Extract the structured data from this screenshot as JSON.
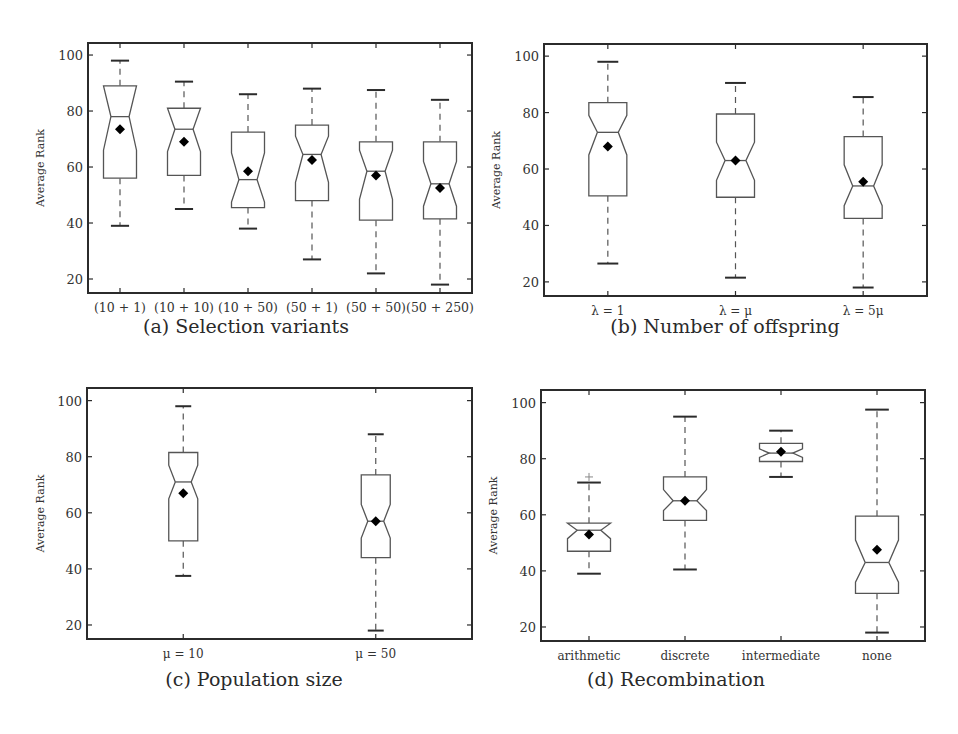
{
  "figure": {
    "panels": [
      {
        "id": "a",
        "caption": "(a) Selection variants"
      },
      {
        "id": "b",
        "caption": "(b) Number of offspring"
      },
      {
        "id": "c",
        "caption": "(c) Population size"
      },
      {
        "id": "d",
        "caption": "(d) Recombination"
      }
    ]
  },
  "chart_data": [
    {
      "type": "boxplot",
      "title": "(a) Selection variants",
      "xlabel": "",
      "ylabel": "Average Rank",
      "ylim": [
        15,
        104.3
      ],
      "yticks": [
        20,
        40,
        60,
        80,
        100
      ],
      "grid": false,
      "notched": true,
      "mean_marker": "diamond",
      "categories": [
        "(10 + 1)",
        "(10 + 10)",
        "(10 + 50)",
        "(50 + 1)",
        "(50 + 50)",
        "(50 + 250)"
      ],
      "boxes": [
        {
          "whisker_low": 39,
          "q1": 56,
          "median": 78,
          "q3": 89,
          "whisker_high": 98,
          "mean": 73.5,
          "notch_low": 66,
          "notch_high": 89,
          "outliers": []
        },
        {
          "whisker_low": 45,
          "q1": 57,
          "median": 73.5,
          "q3": 81,
          "whisker_high": 90.5,
          "mean": 69,
          "notch_low": 65.5,
          "notch_high": 81,
          "outliers": []
        },
        {
          "whisker_low": 38,
          "q1": 45.5,
          "median": 55.5,
          "q3": 72.5,
          "whisker_high": 86,
          "mean": 58.5,
          "notch_low": 47.5,
          "notch_high": 65,
          "outliers": []
        },
        {
          "whisker_low": 27,
          "q1": 48,
          "median": 64.5,
          "q3": 75,
          "whisker_high": 88,
          "mean": 62.5,
          "notch_low": 54.5,
          "notch_high": 71,
          "outliers": []
        },
        {
          "whisker_low": 22,
          "q1": 41,
          "median": 58.5,
          "q3": 69,
          "whisker_high": 87.5,
          "mean": 57,
          "notch_low": 48.5,
          "notch_high": 66,
          "outliers": []
        },
        {
          "whisker_low": 18,
          "q1": 41.5,
          "median": 54,
          "q3": 69,
          "whisker_high": 84,
          "mean": 52.5,
          "notch_low": 46,
          "notch_high": 62,
          "outliers": []
        }
      ]
    },
    {
      "type": "boxplot",
      "title": "(b) Number of offspring",
      "xlabel": "",
      "ylabel": "Average Rank",
      "ylim": [
        15,
        104.3
      ],
      "yticks": [
        20,
        40,
        60,
        80,
        100
      ],
      "grid": false,
      "notched": true,
      "mean_marker": "diamond",
      "categories": [
        "λ = 1",
        "λ = μ",
        "λ = 5μ"
      ],
      "boxes": [
        {
          "whisker_low": 26.5,
          "q1": 50.5,
          "median": 73,
          "q3": 83.5,
          "whisker_high": 98,
          "mean": 68,
          "notch_low": 65,
          "notch_high": 79,
          "outliers": []
        },
        {
          "whisker_low": 21.5,
          "q1": 50,
          "median": 63,
          "q3": 79.5,
          "whisker_high": 90.5,
          "mean": 63,
          "notch_low": 56,
          "notch_high": 69.5,
          "outliers": []
        },
        {
          "whisker_low": 18,
          "q1": 42.5,
          "median": 54,
          "q3": 71.5,
          "whisker_high": 85.5,
          "mean": 55.5,
          "notch_low": 47,
          "notch_high": 61.5,
          "outliers": []
        }
      ]
    },
    {
      "type": "boxplot",
      "title": "(c) Population size",
      "xlabel": "",
      "ylabel": "Average Rank",
      "ylim": [
        15,
        104.5
      ],
      "yticks": [
        20,
        40,
        60,
        80,
        100
      ],
      "grid": false,
      "notched": true,
      "mean_marker": "diamond",
      "categories": [
        "μ = 10",
        "μ = 50"
      ],
      "boxes": [
        {
          "whisker_low": 37.5,
          "q1": 50,
          "median": 71,
          "q3": 81.5,
          "whisker_high": 98,
          "mean": 67,
          "notch_low": 65,
          "notch_high": 77,
          "outliers": []
        },
        {
          "whisker_low": 18,
          "q1": 44,
          "median": 57,
          "q3": 73.5,
          "whisker_high": 88,
          "mean": 57,
          "notch_low": 51,
          "notch_high": 63,
          "outliers": []
        }
      ]
    },
    {
      "type": "boxplot",
      "title": "(d) Recombination",
      "xlabel": "",
      "ylabel": "Average Rank",
      "ylim": [
        15,
        104.5
      ],
      "yticks": [
        20,
        40,
        60,
        80,
        100
      ],
      "grid": false,
      "notched": true,
      "mean_marker": "diamond",
      "categories": [
        "arithmetic",
        "discrete",
        "intermediate",
        "none"
      ],
      "boxes": [
        {
          "whisker_low": 39,
          "q1": 47,
          "median": 54.5,
          "q3": 57,
          "whisker_high": 71.5,
          "mean": 53,
          "notch_low": 51.5,
          "notch_high": 57,
          "outliers": [
            73.5
          ]
        },
        {
          "whisker_low": 40.5,
          "q1": 58,
          "median": 65,
          "q3": 73.5,
          "whisker_high": 95,
          "mean": 65,
          "notch_low": 61.5,
          "notch_high": 69,
          "outliers": []
        },
        {
          "whisker_low": 73.5,
          "q1": 79,
          "median": 82,
          "q3": 85.5,
          "whisker_high": 90,
          "mean": 82.5,
          "notch_low": 80.5,
          "notch_high": 83.5,
          "outliers": []
        },
        {
          "whisker_low": 18,
          "q1": 32,
          "median": 43,
          "q3": 59.5,
          "whisker_high": 97.5,
          "mean": 47.5,
          "notch_low": 36,
          "notch_high": 51,
          "outliers": []
        }
      ]
    }
  ]
}
